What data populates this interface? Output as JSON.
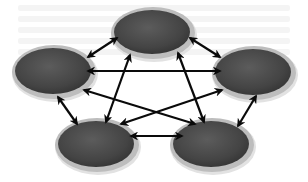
{
  "diagram": {
    "type": "fully-connected-network",
    "colors": {
      "background": "#ffffff",
      "node_fill_dark": "#3a3a3a",
      "node_fill_light": "#5c5c5c",
      "node_rim": "#bdbdbd",
      "node_rim_outer": "#e2e2e2",
      "arrow": "#0a0a0a"
    },
    "nodes": [
      {
        "id": "top",
        "label": "",
        "cx": 153,
        "cy": 33,
        "rx": 42,
        "ry": 26
      },
      {
        "id": "left",
        "label": "",
        "cx": 54,
        "cy": 72,
        "rx": 42,
        "ry": 27
      },
      {
        "id": "right",
        "label": "",
        "cx": 254,
        "cy": 73,
        "rx": 42,
        "ry": 27
      },
      {
        "id": "bottom-left",
        "label": "",
        "cx": 97,
        "cy": 145,
        "rx": 42,
        "ry": 27
      },
      {
        "id": "bottom-right",
        "label": "",
        "cx": 212,
        "cy": 145,
        "rx": 42,
        "ry": 27
      }
    ],
    "edges": [
      {
        "from": "top",
        "to": "left",
        "x1": 117,
        "y1": 38,
        "x2": 88,
        "y2": 57,
        "bidirectional": true
      },
      {
        "from": "top",
        "to": "right",
        "x1": 190,
        "y1": 38,
        "x2": 220,
        "y2": 57,
        "bidirectional": true
      },
      {
        "from": "top",
        "to": "bottom-left",
        "x1": 130,
        "y1": 55,
        "x2": 106,
        "y2": 122,
        "bidirectional": true
      },
      {
        "from": "top",
        "to": "bottom-right",
        "x1": 178,
        "y1": 53,
        "x2": 204,
        "y2": 122,
        "bidirectional": true
      },
      {
        "from": "left",
        "to": "right",
        "x1": 88,
        "y1": 71,
        "x2": 220,
        "y2": 71,
        "bidirectional": true
      },
      {
        "from": "left",
        "to": "bottom-left",
        "x1": 58,
        "y1": 97,
        "x2": 77,
        "y2": 124,
        "bidirectional": true
      },
      {
        "from": "left",
        "to": "bottom-right",
        "x1": 84,
        "y1": 90,
        "x2": 195,
        "y2": 124,
        "bidirectional": true
      },
      {
        "from": "right",
        "to": "bottom-left",
        "x1": 222,
        "y1": 90,
        "x2": 121,
        "y2": 124,
        "bidirectional": true
      },
      {
        "from": "right",
        "to": "bottom-right",
        "x1": 256,
        "y1": 96,
        "x2": 238,
        "y2": 126,
        "bidirectional": true
      },
      {
        "from": "bottom-left",
        "to": "bottom-right",
        "x1": 131,
        "y1": 136,
        "x2": 182,
        "y2": 136,
        "bidirectional": true
      }
    ]
  }
}
